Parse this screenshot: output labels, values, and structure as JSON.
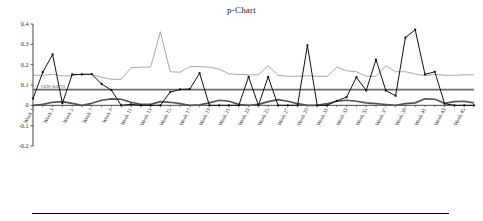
{
  "figure": {
    "title": "p-Chart",
    "bottom_rule": true
  },
  "axes": {
    "y_ticks": [
      "0.4",
      "0.3",
      "0.2",
      "0.1",
      "0",
      "-0.1",
      "-0.2"
    ],
    "y_tick_values": [
      0.4,
      0.3,
      0.2,
      0.1,
      0,
      -0.1,
      -0.2
    ],
    "ylim": [
      -0.2,
      0.4
    ],
    "x_tick_labels": [
      "Week 1",
      "Week 3",
      "Week 5",
      "Week 7",
      "Week 9",
      "Week 11",
      "Week 13",
      "Week 15",
      "Week 17",
      "Week 19",
      "Week 21",
      "Week 23",
      "Week 25",
      "Week 27",
      "Week 29",
      "Week 31",
      "Week 33",
      "Week 35",
      "Week 37",
      "Week 39",
      "Week 41",
      "Week 43",
      "Week 45"
    ]
  },
  "annotations": {
    "center_line_label": "CLN=0.0772"
  },
  "colors": {
    "p_series": "#111111",
    "ucl_series": "#8a8a8a",
    "lcl_series": "#555555",
    "center_line": "#6b6b6b",
    "axis": "#333333",
    "background": "#ffffff"
  },
  "chart_data": {
    "type": "line",
    "title": "p-Chart",
    "xlabel": "",
    "ylabel": "",
    "ylim": [
      -0.2,
      0.4
    ],
    "grid": false,
    "legend_position": "none",
    "x": [
      "Week 1",
      "Week 2",
      "Week 3",
      "Week 4",
      "Week 5",
      "Week 6",
      "Week 7",
      "Week 8",
      "Week 9",
      "Week 10",
      "Week 11",
      "Week 12",
      "Week 13",
      "Week 14",
      "Week 15",
      "Week 16",
      "Week 17",
      "Week 18",
      "Week 19",
      "Week 20",
      "Week 21",
      "Week 22",
      "Week 23",
      "Week 24",
      "Week 25",
      "Week 26",
      "Week 27",
      "Week 28",
      "Week 29",
      "Week 30",
      "Week 31",
      "Week 32",
      "Week 33",
      "Week 34",
      "Week 35",
      "Week 36",
      "Week 37",
      "Week 38",
      "Week 39",
      "Week 40",
      "Week 41",
      "Week 42",
      "Week 43",
      "Week 44",
      "Week 45",
      "Week 46"
    ],
    "series": [
      {
        "name": "p",
        "style": "line-with-markers",
        "color": "#111111",
        "values": [
          0.033,
          0.163,
          0.25,
          0.01,
          0.152,
          0.152,
          0.153,
          0.105,
          0.075,
          0.0,
          0.005,
          0.0,
          0.0,
          0.0,
          0.065,
          0.078,
          0.08,
          0.158,
          0.0,
          0.0,
          0.0,
          0.0,
          0.14,
          0.0,
          0.14,
          0.0,
          0.0,
          0.0,
          0.295,
          0.0,
          0.0,
          0.022,
          0.04,
          0.138,
          0.073,
          0.225,
          0.073,
          0.047,
          0.333,
          0.372,
          0.152,
          0.165,
          0.008,
          0.0,
          0.0,
          0.0
        ]
      },
      {
        "name": "UCL",
        "style": "thin-line",
        "color": "#8a8a8a",
        "values": [
          0.148,
          0.148,
          0.152,
          0.145,
          0.145,
          0.155,
          0.152,
          0.138,
          0.128,
          0.128,
          0.185,
          0.188,
          0.188,
          0.362,
          0.165,
          0.163,
          0.19,
          0.19,
          0.188,
          0.178,
          0.155,
          0.152,
          0.15,
          0.15,
          0.195,
          0.148,
          0.143,
          0.143,
          0.145,
          0.143,
          0.142,
          0.188,
          0.17,
          0.165,
          0.143,
          0.143,
          0.195,
          0.165,
          0.165,
          0.155,
          0.145,
          0.152,
          0.148,
          0.148,
          0.15,
          0.15
        ]
      },
      {
        "name": "LCL",
        "style": "thick-line",
        "color": "#555555",
        "values": [
          0.0,
          0.005,
          0.015,
          0.018,
          0.01,
          0.0,
          0.01,
          0.025,
          0.032,
          0.03,
          0.015,
          0.005,
          0.005,
          0.018,
          0.015,
          0.008,
          0.0,
          0.002,
          0.012,
          0.025,
          0.02,
          0.005,
          0.0,
          0.005,
          0.018,
          0.028,
          0.02,
          0.008,
          0.0,
          0.0,
          0.008,
          0.02,
          0.025,
          0.02,
          0.012,
          0.008,
          0.004,
          0.0,
          0.008,
          0.012,
          0.032,
          0.03,
          0.01,
          0.018,
          0.02,
          0.012
        ]
      }
    ],
    "reference_lines": [
      {
        "name": "center-line",
        "orientation": "horizontal",
        "value": 0.0772,
        "label": "CLN=0.0772",
        "color": "#6b6b6b"
      }
    ]
  }
}
